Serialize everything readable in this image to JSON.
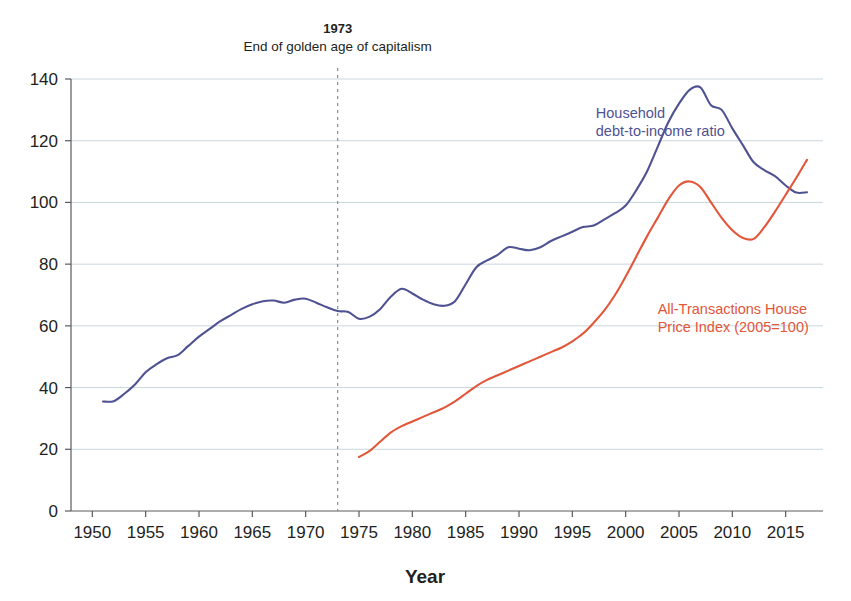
{
  "chart_data": {
    "type": "line",
    "title": "",
    "xlabel": "Year",
    "ylabel": "",
    "xlim": [
      1948,
      2018.5
    ],
    "ylim": [
      0,
      140
    ],
    "grid": true,
    "grid_axis": "y",
    "legend_position": "inline-annotations",
    "x_ticks": [
      1950,
      1955,
      1960,
      1965,
      1970,
      1975,
      1980,
      1985,
      1990,
      1995,
      2000,
      2005,
      2010,
      2015
    ],
    "x_tick_labels": [
      "1950",
      "1955",
      "1960",
      "1965",
      "1970",
      "1975",
      "1980",
      "1985",
      "1990",
      "1995",
      "2000",
      "2005",
      "2010",
      "2015"
    ],
    "y_ticks": [
      0,
      20,
      40,
      60,
      80,
      100,
      120,
      140
    ],
    "y_tick_labels": [
      "0",
      "20",
      "40",
      "60",
      "80",
      "100",
      "120",
      "140"
    ],
    "annotations": [
      {
        "name": "golden-age-marker",
        "x": 1973,
        "title": "1973",
        "subtitle": "End of golden age of capitalism",
        "line_style": "dashed",
        "color": "#8a8a8a"
      }
    ],
    "series": [
      {
        "name": "Household debt-to-income ratio",
        "label_lines": [
          "Household",
          "debt-to-income ratio"
        ],
        "color": "#4f5291",
        "label_x": 1997.2,
        "label_y": 127.5,
        "x": [
          1951,
          1952,
          1953,
          1954,
          1955,
          1956,
          1957,
          1958,
          1959,
          1960,
          1961,
          1962,
          1963,
          1964,
          1965,
          1966,
          1967,
          1968,
          1969,
          1970,
          1971,
          1972,
          1973,
          1974,
          1975,
          1976,
          1977,
          1978,
          1979,
          1980,
          1981,
          1982,
          1983,
          1984,
          1985,
          1986,
          1987,
          1988,
          1989,
          1990,
          1991,
          1992,
          1993,
          1994,
          1995,
          1996,
          1997,
          1998,
          1999,
          2000,
          2001,
          2002,
          2003,
          2004,
          2005,
          2006,
          2007,
          2008,
          2009,
          2010,
          2011,
          2012,
          2013,
          2014,
          2015,
          2016,
          2017
        ],
        "y": [
          35.5,
          35.6,
          38.0,
          41.0,
          45.0,
          47.5,
          49.5,
          50.5,
          53.5,
          56.5,
          59.0,
          61.5,
          63.5,
          65.5,
          67.0,
          68.0,
          68.2,
          67.5,
          68.5,
          68.8,
          67.5,
          66.0,
          64.8,
          64.5,
          62.3,
          63.0,
          65.5,
          69.5,
          72.0,
          70.5,
          68.5,
          67.0,
          66.5,
          68.0,
          73.5,
          79.0,
          81.2,
          83.0,
          85.5,
          85.0,
          84.5,
          85.5,
          87.5,
          89.0,
          90.5,
          92.0,
          92.5,
          94.5,
          96.5,
          99.0,
          104.0,
          110.0,
          118.0,
          126.0,
          132.0,
          136.5,
          137.3,
          131.5,
          130.0,
          124.0,
          118.5,
          113.0,
          110.5,
          108.5,
          105.5,
          103.2,
          103.3
        ]
      },
      {
        "name": "All-Transactions House Price Index (2005=100)",
        "label_lines": [
          "All-Transactions House",
          "Price Index (2005=100)"
        ],
        "color": "#e2563a",
        "label_x": 2003.0,
        "label_y": 64.0,
        "x": [
          1975,
          1976,
          1977,
          1978,
          1979,
          1980,
          1981,
          1982,
          1983,
          1984,
          1985,
          1986,
          1987,
          1988,
          1989,
          1990,
          1991,
          1992,
          1993,
          1994,
          1995,
          1996,
          1997,
          1998,
          1999,
          2000,
          2001,
          2002,
          2003,
          2004,
          2005,
          2006,
          2007,
          2008,
          2009,
          2010,
          2011,
          2012,
          2013,
          2014,
          2015,
          2016,
          2017
        ],
        "y": [
          17.5,
          19.5,
          22.5,
          25.5,
          27.5,
          29.0,
          30.5,
          32.0,
          33.5,
          35.5,
          38.0,
          40.5,
          42.5,
          44.0,
          45.5,
          47.0,
          48.5,
          50.0,
          51.5,
          53.0,
          55.0,
          57.5,
          61.0,
          65.0,
          70.0,
          76.0,
          82.5,
          89.0,
          95.0,
          101.0,
          105.5,
          106.8,
          105.0,
          100.0,
          95.0,
          91.0,
          88.5,
          88.2,
          92.0,
          97.0,
          102.5,
          108.0,
          113.8
        ]
      }
    ]
  }
}
